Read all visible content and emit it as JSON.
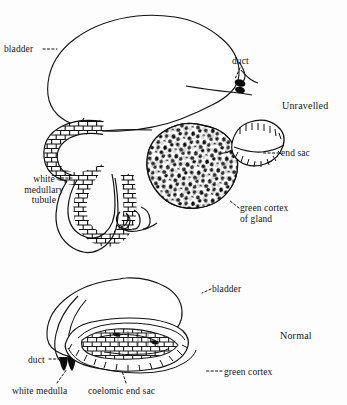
{
  "figure": {
    "type": "scientific-anatomical-diagram",
    "background_color": "#fdfdfd",
    "ink_color": "#111111",
    "panels": [
      {
        "id": "unravelled",
        "title": "Unravelled",
        "labels": [
          {
            "key": "bladder",
            "text": "bladder"
          },
          {
            "key": "duct",
            "text": "duct"
          },
          {
            "key": "end_sac",
            "text": "end sac"
          },
          {
            "key": "white_medullary_tubule",
            "text": "white medullary tubule"
          },
          {
            "key": "green_cortex_of_gland",
            "text": "green cortex of gland"
          }
        ],
        "parts": [
          "bladder",
          "duct",
          "white medullary tubule",
          "green cortex of gland",
          "end sac"
        ]
      },
      {
        "id": "normal",
        "title": "Normal",
        "labels": [
          {
            "key": "bladder",
            "text": "bladder"
          },
          {
            "key": "duct",
            "text": "duct"
          },
          {
            "key": "green_cortex",
            "text": "green cortex"
          },
          {
            "key": "white_medulla",
            "text": "white medulla"
          },
          {
            "key": "coelomic_end_sac",
            "text": "coelomic end sac"
          }
        ],
        "parts": [
          "bladder",
          "duct",
          "green cortex",
          "white medulla",
          "coelomic end sac"
        ]
      }
    ]
  },
  "unravelled": {
    "title": "Unravelled",
    "bladder_label": "bladder",
    "duct_label": "duct",
    "end_sac_label": "end sac",
    "white_medullary_tubule_line1": "white",
    "white_medullary_tubule_line2": "medullary",
    "white_medullary_tubule_line3": "tubule",
    "green_cortex_line1": "green cortex",
    "green_cortex_line2": "of gland"
  },
  "normal": {
    "title": "Normal",
    "bladder_label": "bladder",
    "duct_label": "duct",
    "green_cortex_label": "green cortex",
    "white_medulla_label": "white medulla",
    "coelomic_end_sac_label": "coelomic end sac"
  }
}
